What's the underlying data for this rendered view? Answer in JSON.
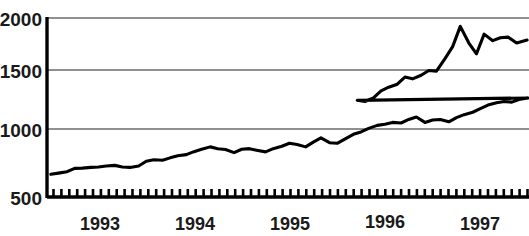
{
  "chart_data": {
    "type": "line",
    "title": "",
    "subtitle": "",
    "xlabel": "",
    "ylabel": "",
    "ylim": [
      500,
      2000
    ],
    "yticks": [
      500,
      1000,
      1500,
      2000
    ],
    "ytick_labels": [
      "500",
      "1000",
      "1500",
      "2000"
    ],
    "xtick_labels": [
      "1993",
      "1994",
      "1995",
      "1996",
      "1997"
    ],
    "xtick_values": [
      1993,
      1994,
      1995,
      1996,
      1997
    ],
    "xlim": [
      1992.75,
      1997.8
    ],
    "grid": "horizontal",
    "legend": "none",
    "minor_ticks": "monthly",
    "series": [
      {
        "name": "index",
        "color": "#000000",
        "x": [
          1992.79,
          1992.87,
          1992.96,
          1993.04,
          1993.12,
          1993.21,
          1993.29,
          1993.37,
          1993.46,
          1993.54,
          1993.62,
          1993.71,
          1993.79,
          1993.87,
          1993.96,
          1994.04,
          1994.12,
          1994.21,
          1994.29,
          1994.37,
          1994.46,
          1994.54,
          1994.62,
          1994.71,
          1994.79,
          1994.87,
          1994.96,
          1995.04,
          1995.12,
          1995.21,
          1995.29,
          1995.37,
          1995.46,
          1995.54,
          1995.62,
          1995.71,
          1995.79,
          1995.87,
          1995.96,
          1996.04,
          1996.12,
          1996.21,
          1996.29,
          1996.37,
          1996.46,
          1996.54,
          1996.62,
          1996.71,
          1996.79,
          1996.87,
          1996.96,
          1997.04,
          1997.12,
          1997.21,
          1997.29,
          1997.37,
          1997.46,
          1997.54,
          1997.62,
          1997.71,
          1997.79
        ],
        "values": [
          690,
          700,
          712,
          740,
          742,
          748,
          752,
          760,
          765,
          752,
          748,
          760,
          800,
          812,
          808,
          828,
          845,
          855,
          880,
          900,
          920,
          905,
          898,
          872,
          900,
          905,
          890,
          878,
          905,
          925,
          950,
          940,
          920,
          960,
          995,
          955,
          950,
          985,
          1025,
          1045,
          1075,
          1100,
          1110,
          1125,
          1120,
          1150,
          1170,
          1125,
          1145,
          1150,
          1130,
          1165,
          1190,
          1210,
          1240,
          1270,
          1290,
          1300,
          1295,
          1320,
          1330
        ]
      }
    ],
    "series_extended_x": [
      1996.0,
      1996.08,
      1996.17,
      1996.25,
      1996.33,
      1996.42,
      1996.5,
      1996.58,
      1996.67,
      1996.75,
      1996.83,
      1996.92,
      1997.0,
      1997.08,
      1997.17,
      1997.25,
      1997.33,
      1997.42,
      1997.5,
      1997.58,
      1997.67,
      1997.78
    ],
    "series_extended_values": [
      1310,
      1300,
      1330,
      1390,
      1420,
      1445,
      1505,
      1490,
      1520,
      1560,
      1555,
      1660,
      1760,
      1930,
      1790,
      1700,
      1865,
      1810,
      1835,
      1840,
      1790,
      1815
    ]
  },
  "axis": {
    "y_labels": [
      "2000",
      "1500",
      "1000",
      "500"
    ],
    "x_labels": [
      "1993",
      "1994",
      "1995",
      "1996",
      "1997"
    ]
  },
  "colors": {
    "line": "#000000",
    "grid": "#6b6b6b",
    "axis": "#000000",
    "text": "#1a1a1a",
    "background": "#ffffff"
  }
}
